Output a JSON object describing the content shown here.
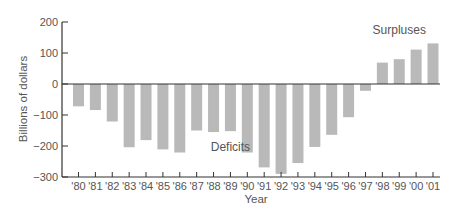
{
  "chart_data": {
    "type": "bar",
    "title": "",
    "xlabel": "Year",
    "ylabel": "Billions of dollars",
    "ylim": [
      -300,
      200
    ],
    "yticks": [
      200,
      100,
      0,
      -100,
      -200,
      -300
    ],
    "ytick_labels": [
      "200",
      "100",
      "0",
      "−100",
      "−200",
      "−300"
    ],
    "categories": [
      "'80",
      "'81",
      "'82",
      "'83",
      "'84",
      "'85",
      "'86",
      "'87",
      "'88",
      "'89",
      "'90",
      "'91",
      "'92",
      "'93",
      "'94",
      "'95",
      "'96",
      "'97",
      "'98",
      "'99",
      "'00",
      "'01"
    ],
    "values": [
      -72,
      -84,
      -121,
      -204,
      -181,
      -211,
      -221,
      -150,
      -155,
      -152,
      -221,
      -269,
      -290,
      -255,
      -203,
      -164,
      -107,
      -22,
      69,
      80,
      111,
      131
    ],
    "annotations": [
      {
        "text": "Deficits",
        "x": "'89",
        "y": -215
      },
      {
        "text": "Surpluses",
        "x": "'99",
        "y": 160
      }
    ],
    "grid": false,
    "legend": null,
    "bar_color": "#b9b9b9",
    "axis_color": "#333333"
  }
}
